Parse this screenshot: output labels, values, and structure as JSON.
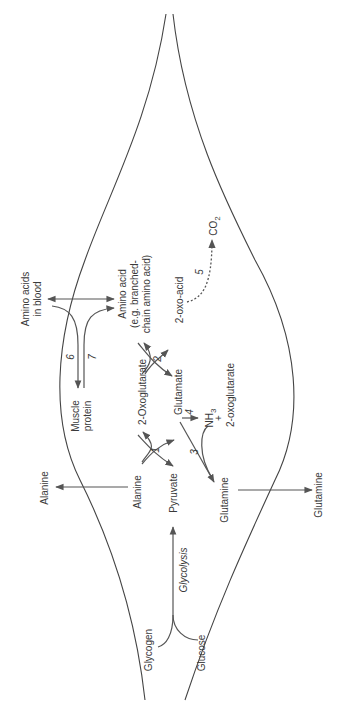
{
  "diagram": {
    "orientation": "rotated 90° counter-clockwise (text reads bottom-to-top)",
    "colors": {
      "line": "#555555",
      "text": "#3a3a3a",
      "background": "#ffffff"
    },
    "nodes": {
      "amino_acids_blood_1": "Amino acids",
      "amino_acids_blood_2": "in blood",
      "muscle_protein_1": "Muscle",
      "muscle_protein_2": "protein",
      "amino_acid_1": "Amino acid",
      "amino_acid_2": "(e.g. branched-",
      "amino_acid_3": "chain amino acid)",
      "oxo_acid": "2-oxo-acid",
      "co2": "CO",
      "co2_sub": "2",
      "oxoglutarate": "2-Oxoglutarate",
      "glutamate": "Glutamate",
      "nh3": "NH",
      "nh3_sub": "3",
      "plus": "+",
      "oxoglutarate_small": "2-oxoglutarate",
      "alanine_inner": "Alanine",
      "alanine_outer": "Alanine",
      "pyruvate": "Pyruvate",
      "glycolysis": "Glycolysis",
      "glutamine_inner": "Glutamine",
      "glutamine_outer": "Glutamine",
      "glycogen": "Glycogen",
      "glucose": "Glucose"
    },
    "reactions": {
      "r1": "1",
      "r2": "2",
      "r3": "3",
      "r4": "4",
      "r5": "5",
      "r6": "6",
      "r7": "7"
    }
  }
}
